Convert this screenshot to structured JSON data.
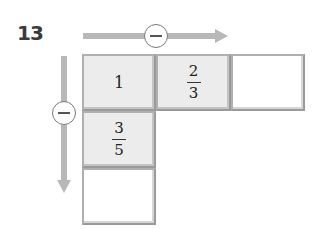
{
  "question_number": "13",
  "operations": {
    "horizontal": {
      "symbol": "minus",
      "direction": "right"
    },
    "vertical": {
      "symbol": "minus",
      "direction": "down"
    }
  },
  "grid": {
    "row1": [
      {
        "type": "whole",
        "value": "1"
      },
      {
        "type": "fraction",
        "numerator": "2",
        "denominator": "3"
      },
      {
        "type": "empty",
        "value": ""
      }
    ],
    "col1": [
      {
        "type": "whole",
        "value": "1"
      },
      {
        "type": "fraction",
        "numerator": "3",
        "denominator": "5"
      },
      {
        "type": "empty",
        "value": ""
      }
    ]
  },
  "colors": {
    "arrow": "#b8b8b8",
    "filled_cell": "#ececec",
    "cell_border": "#9a9a9a"
  }
}
